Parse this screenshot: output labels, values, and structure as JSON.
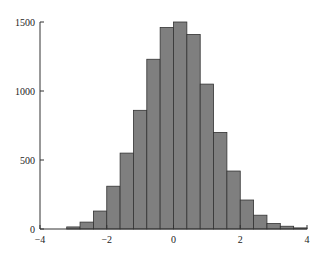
{
  "chart_data": {
    "type": "bar",
    "subtype": "histogram",
    "title": "",
    "xlabel": "",
    "ylabel": "",
    "xlim": [
      -4,
      4
    ],
    "ylim": [
      0,
      1500
    ],
    "grid": false,
    "legend": null,
    "bar_color": "#7f7f7f",
    "edge_color": "#333333",
    "bin_width": 0.4,
    "bin_edges": [
      -3.2,
      -2.8,
      -2.4,
      -2.0,
      -1.6,
      -1.2,
      -0.8,
      -0.4,
      0.0,
      0.4,
      0.8,
      1.2,
      1.6,
      2.0,
      2.4,
      2.8,
      3.2,
      3.6,
      4.0
    ],
    "values": [
      15,
      50,
      130,
      310,
      550,
      860,
      1230,
      1460,
      1500,
      1410,
      1050,
      700,
      420,
      210,
      100,
      40,
      20,
      8
    ],
    "x_ticks": [
      -4,
      -2,
      0,
      2,
      4
    ],
    "x_tick_labels": [
      "−4",
      "−2",
      "0",
      "2",
      "4"
    ],
    "y_ticks": [
      0,
      500,
      1000,
      1500
    ],
    "y_tick_labels": [
      "0",
      "500",
      "1000",
      "1500"
    ]
  }
}
